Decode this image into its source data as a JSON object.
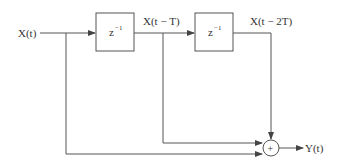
{
  "diagram": {
    "input_label": "X(t)",
    "output_label": "Y(t)",
    "delay_blocks": [
      {
        "base": "z",
        "exponent": "−1"
      },
      {
        "base": "z",
        "exponent": "−1"
      }
    ],
    "tap_labels": [
      "X(t − T)",
      "X(t − 2T)"
    ],
    "summer_symbol": "+",
    "colors": {
      "stroke": "#555555",
      "text": "#333333"
    }
  }
}
